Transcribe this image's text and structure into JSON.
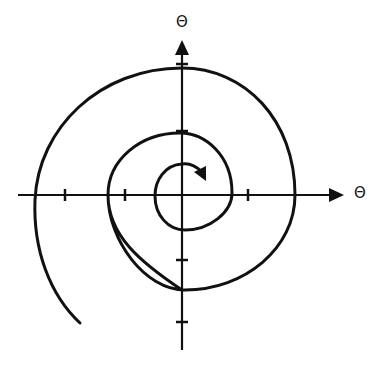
{
  "diagram": {
    "type": "phase-plane-spiral",
    "axes": {
      "horizontal_label": "Θ",
      "vertical_label": "Θ"
    },
    "colors": {
      "ink": "#111111",
      "background": "#ffffff"
    }
  }
}
